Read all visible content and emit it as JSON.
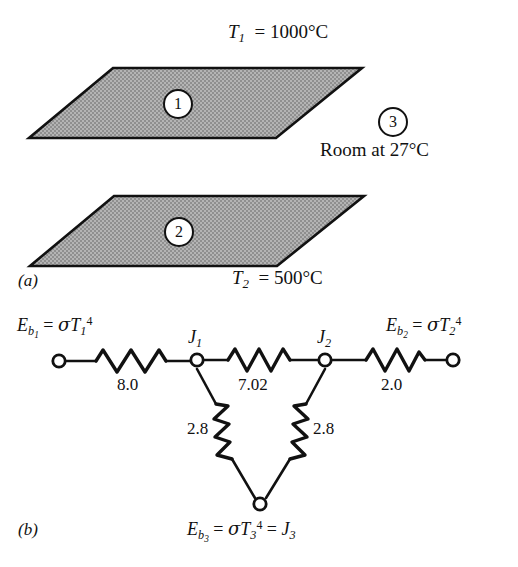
{
  "figure": {
    "panel_a": {
      "label": "(a)",
      "top_plate_temp": "T1 = 1000°C",
      "top_plate_temp_parts": {
        "symbol": "T",
        "sub": "1",
        "value": "1000°C"
      },
      "bottom_plate_temp_parts": {
        "symbol": "T",
        "sub": "2",
        "value": "500°C"
      },
      "surface_1_id": "1",
      "surface_2_id": "2",
      "surface_3_id": "3",
      "room_label": "Room at 27°C",
      "plate_fill_color": "#a9a9a9",
      "outline_color": "#111111"
    },
    "panel_b": {
      "label": "(b)",
      "left_terminal": {
        "E": "E",
        "sub": "b",
        "subnum": "1",
        "eq": "=",
        "sigma": "σ",
        "T": "T",
        "Tsub": "1",
        "Tsup": "4"
      },
      "right_terminal": {
        "E": "E",
        "sub": "b",
        "subnum": "2",
        "eq": "=",
        "sigma": "σ",
        "T": "T",
        "Tsub": "2",
        "Tsup": "4"
      },
      "bottom_terminal": {
        "E": "E",
        "sub": "b",
        "subnum": "3",
        "eq": "=",
        "sigma": "σ",
        "T": "T",
        "Tsub": "3",
        "Tsup": "4",
        "eq2": "=",
        "J": "J",
        "Jsub": "3"
      },
      "node_j1": {
        "symbol": "J",
        "sub": "1"
      },
      "node_j2": {
        "symbol": "J",
        "sub": "2"
      },
      "resistors": [
        {
          "name": "left-surface-resistance",
          "value": "8.0"
        },
        {
          "name": "space-resistance-1-2",
          "value": "7.02"
        },
        {
          "name": "space-resistance-1-3",
          "value": "2.8"
        },
        {
          "name": "space-resistance-2-3",
          "value": "2.8"
        },
        {
          "name": "right-surface-resistance",
          "value": "2.0"
        }
      ]
    }
  }
}
